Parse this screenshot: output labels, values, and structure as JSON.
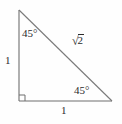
{
  "figure": {
    "background_color": "#fefefe",
    "line_color": "#6e6e6e",
    "text_color": "#2b2b2b",
    "labels": {
      "angle_apex": "45°",
      "angle_base_right": "45°",
      "leg_vertical": "1",
      "leg_horizontal": "1",
      "hypotenuse_radical_sign": "√",
      "hypotenuse_radicand": "2",
      "right_angle_marker": "right-angle"
    },
    "geometry": {
      "apex_x": 19,
      "apex_y": 10,
      "bottom_left_x": 19,
      "bottom_left_y": 101,
      "bottom_right_x": 112,
      "bottom_right_y": 101,
      "right_angle_box_size": 6
    }
  }
}
